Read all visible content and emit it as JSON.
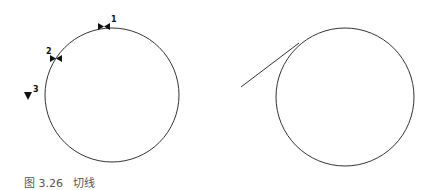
{
  "figure": {
    "caption": "图 3.26   切线",
    "left_panel": {
      "circle": {
        "cx": 112,
        "cy": 95,
        "r": 67
      },
      "markers": [
        {
          "label": "1",
          "x": 104,
          "y": 26,
          "type": "bowtie"
        },
        {
          "label": "2",
          "x": 56,
          "y": 58,
          "type": "bowtie"
        },
        {
          "label": "3",
          "x": 28,
          "y": 97,
          "type": "triangle-down"
        }
      ]
    },
    "right_panel": {
      "circle": {
        "cx": 345,
        "cy": 97,
        "r": 69
      },
      "tangent_line": {
        "x1": 241,
        "y1": 87,
        "x2": 299,
        "y2": 43
      }
    },
    "colors": {
      "stroke": "#333333",
      "marker": "#111111",
      "caption": "#555555"
    }
  }
}
